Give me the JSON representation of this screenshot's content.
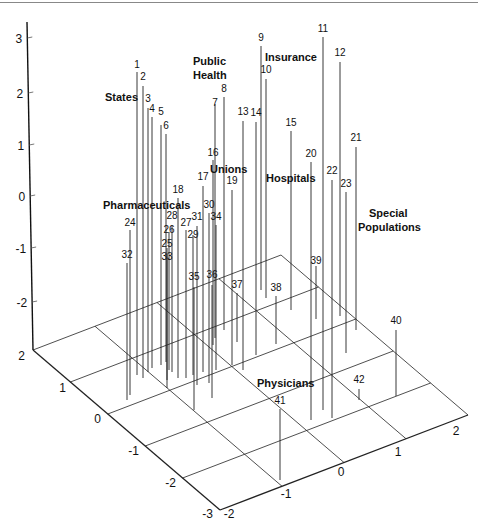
{
  "chart_data": {
    "type": "scatter3d",
    "title": "",
    "xlabel": "",
    "ylabel": "",
    "zlabel": "",
    "x_ticks": [
      "-2",
      "-1",
      "0",
      "1",
      "2"
    ],
    "y_ticks": [
      "2",
      "1",
      "0",
      "-1",
      "-2",
      "-3"
    ],
    "z_ticks": [
      "3",
      "2",
      "1",
      "0",
      "-1",
      "-2"
    ],
    "xlim": [
      -2,
      2
    ],
    "ylim": [
      -3,
      2
    ],
    "zlim": [
      -2.6,
      3.2
    ],
    "grid": true,
    "style": "stem plot: numbered points with vertical drop lines to floor grid",
    "group_labels": [
      {
        "text": "States",
        "x": 105,
        "y": 101
      },
      {
        "text": "Public",
        "x": 193,
        "y": 65
      },
      {
        "text": "Health",
        "x": 193,
        "y": 79
      },
      {
        "text": "Insurance",
        "x": 265,
        "y": 61
      },
      {
        "text": "Unions",
        "x": 210,
        "y": 173
      },
      {
        "text": "Hospitals",
        "x": 266,
        "y": 182
      },
      {
        "text": "Pharmaceuticals",
        "x": 103,
        "y": 209
      },
      {
        "text": "Special",
        "x": 369,
        "y": 217
      },
      {
        "text": "Populations",
        "x": 358,
        "y": 231
      },
      {
        "text": "Physicians",
        "x": 257,
        "y": 387
      }
    ],
    "points": [
      {
        "id": "1",
        "tx": 137,
        "ty": 70,
        "ly": 72,
        "by": 375
      },
      {
        "id": "2",
        "tx": 143,
        "ty": 82,
        "ly": 86,
        "by": 378
      },
      {
        "id": "3",
        "tx": 148,
        "ty": 104,
        "ly": 108,
        "by": 372
      },
      {
        "id": "4",
        "tx": 152,
        "ty": 114,
        "ly": 117,
        "by": 368
      },
      {
        "id": "5",
        "tx": 161,
        "ty": 117,
        "ly": 125,
        "by": 365
      },
      {
        "id": "6",
        "tx": 166,
        "ty": 131,
        "ly": 134,
        "by": 362
      },
      {
        "id": "7",
        "tx": 215,
        "ty": 108,
        "ly": 104,
        "by": 338
      },
      {
        "id": "8",
        "tx": 224,
        "ty": 94,
        "ly": 97,
        "by": 330
      },
      {
        "id": "9",
        "tx": 261,
        "ty": 43,
        "ly": 46,
        "by": 290
      },
      {
        "id": "10",
        "tx": 266,
        "ty": 75,
        "ly": 79,
        "by": 298
      },
      {
        "id": "11",
        "tx": 323,
        "ty": 34,
        "ly": 37,
        "by": 410
      },
      {
        "id": "12",
        "tx": 340,
        "ty": 58,
        "ly": 62,
        "by": 316
      },
      {
        "id": "13",
        "tx": 243,
        "ty": 117,
        "ly": 121,
        "by": 370
      },
      {
        "id": "14",
        "tx": 256,
        "ty": 118,
        "ly": 122,
        "by": 355
      },
      {
        "id": "15",
        "tx": 291,
        "ty": 128,
        "ly": 131,
        "by": 310
      },
      {
        "id": "16",
        "tx": 213,
        "ty": 158,
        "ly": 160,
        "by": 345
      },
      {
        "id": "17",
        "tx": 203,
        "ty": 182,
        "ly": 186,
        "by": 372
      },
      {
        "id": "18",
        "tx": 178,
        "ty": 195,
        "ly": 198,
        "by": 378
      },
      {
        "id": "19",
        "tx": 232,
        "ty": 186,
        "ly": 190,
        "by": 365
      },
      {
        "id": "20",
        "tx": 311,
        "ty": 159,
        "ly": 162,
        "by": 420
      },
      {
        "id": "21",
        "tx": 356,
        "ty": 143,
        "ly": 147,
        "by": 330
      },
      {
        "id": "22",
        "tx": 332,
        "ty": 176,
        "ly": 180,
        "by": 418
      },
      {
        "id": "23",
        "tx": 346,
        "ty": 189,
        "ly": 192,
        "by": 353
      },
      {
        "id": "24",
        "tx": 130,
        "ty": 228,
        "ly": 230,
        "by": 395
      },
      {
        "id": "25",
        "tx": 167,
        "ty": 249,
        "ly": 248,
        "by": 380
      },
      {
        "id": "26",
        "tx": 169,
        "ty": 235,
        "ly": 232,
        "by": 370
      },
      {
        "id": "27",
        "tx": 186,
        "ty": 228,
        "ly": 230,
        "by": 378
      },
      {
        "id": "28",
        "tx": 172,
        "ty": 221,
        "ly": 225,
        "by": 372
      },
      {
        "id": "29",
        "tx": 193,
        "ty": 240,
        "ly": 235,
        "by": 375
      },
      {
        "id": "30",
        "tx": 209,
        "ty": 210,
        "ly": 213,
        "by": 383
      },
      {
        "id": "31",
        "tx": 197,
        "ty": 222,
        "ly": 226,
        "by": 385
      },
      {
        "id": "32",
        "tx": 127,
        "ty": 260,
        "ly": 263,
        "by": 400
      },
      {
        "id": "33",
        "tx": 167,
        "ty": 262,
        "ly": 254,
        "by": 388
      },
      {
        "id": "34",
        "tx": 216,
        "ty": 222,
        "ly": 225,
        "by": 370
      },
      {
        "id": "35",
        "tx": 194,
        "ty": 282,
        "ly": 287,
        "by": 410
      },
      {
        "id": "36",
        "tx": 212,
        "ty": 280,
        "ly": 285,
        "by": 398
      },
      {
        "id": "37",
        "tx": 237,
        "ty": 290,
        "ly": 293,
        "by": 342
      },
      {
        "id": "38",
        "tx": 276,
        "ty": 293,
        "ly": 296,
        "by": 344
      },
      {
        "id": "39",
        "tx": 316,
        "ty": 266,
        "ly": 266,
        "by": 319
      },
      {
        "id": "40",
        "tx": 396,
        "ty": 326,
        "ly": 330,
        "by": 396
      },
      {
        "id": "41",
        "tx": 280,
        "ty": 406,
        "ly": 409,
        "by": 480
      },
      {
        "id": "42",
        "tx": 359,
        "ty": 385,
        "ly": 389,
        "by": 400
      }
    ]
  }
}
